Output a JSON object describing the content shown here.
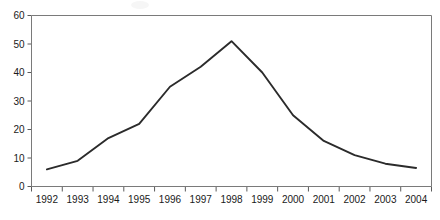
{
  "chart_data": {
    "type": "line",
    "title": "",
    "subtitle": "",
    "xlabel": "",
    "ylabel": "",
    "categories": [
      "1992",
      "1993",
      "1994",
      "1995",
      "1996",
      "1997",
      "1998",
      "1999",
      "2000",
      "2001",
      "2002",
      "2003",
      "2004"
    ],
    "values": [
      6,
      9,
      17,
      22,
      35,
      42,
      51,
      40,
      25,
      16,
      11,
      8,
      6.5
    ],
    "series": [
      {
        "name": "",
        "values": [
          6,
          9,
          17,
          22,
          35,
          42,
          51,
          40,
          25,
          16,
          11,
          8,
          6.5
        ]
      }
    ],
    "ylim": [
      0,
      60
    ],
    "ytick_labels": [
      "0",
      "10",
      "20",
      "30",
      "40",
      "50",
      "60"
    ],
    "ytick_values": [
      0,
      10,
      20,
      30,
      40,
      50,
      60
    ],
    "xtick_labels": [
      "1992",
      "1993",
      "1994",
      "1995",
      "1996",
      "1997",
      "1998",
      "1999",
      "2000",
      "2001",
      "2002",
      "2003",
      "2004"
    ],
    "grid": false,
    "legend": null,
    "legend_position": "none",
    "annotations": [],
    "line_color": "#2b2b2b",
    "axis_color": "#7a7a7a",
    "background_color": "#ffffff"
  }
}
